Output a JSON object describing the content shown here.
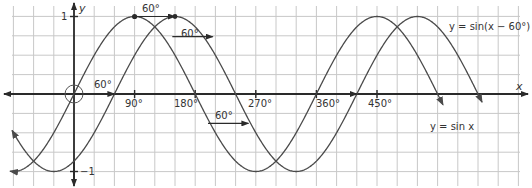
{
  "chart_data": {
    "type": "line",
    "title": "",
    "xlabel": "x",
    "ylabel": "y",
    "x_unit": "degrees",
    "xlim": [
      -96,
      680
    ],
    "ylim": [
      -1,
      1
    ],
    "grid": true,
    "x_ticks": [
      {
        "value": 90,
        "label": "90°"
      },
      {
        "value": 180,
        "label": "180°"
      },
      {
        "value": 270,
        "label": "270°"
      },
      {
        "value": 360,
        "label": "360°"
      },
      {
        "value": 450,
        "label": "450°"
      }
    ],
    "y_ticks": [
      {
        "value": 1,
        "label": "1"
      },
      {
        "value": -1,
        "label": "−1"
      }
    ],
    "series": [
      {
        "name": "y = sin x",
        "function": "sin(x)",
        "shift": 0,
        "x_start": -95,
        "x_end": 548
      },
      {
        "name": "y = sin(x − 60°)",
        "function": "sin(x - 60)",
        "shift": 60,
        "x_start": -92,
        "x_end": 606
      }
    ],
    "annotations": [
      {
        "text": "60°",
        "type": "shift-arrow",
        "from": 0,
        "to": 60,
        "y": 0
      },
      {
        "text": "60°",
        "type": "shift-arrow",
        "from": 90,
        "to": 150,
        "y": 1
      },
      {
        "text": "60°",
        "type": "shift-arrow",
        "from": 146,
        "to": 206,
        "y": 0.74
      },
      {
        "text": "60°",
        "type": "shift-arrow",
        "from": 199,
        "to": 259,
        "y": -0.38
      },
      {
        "text": "60°",
        "type": "shift-arrow",
        "from": 360,
        "to": 420,
        "y": 0
      }
    ]
  },
  "labels": {
    "x_axis": "x",
    "y_axis": "y",
    "y_max": "1",
    "y_min": "−1",
    "tick_90": "90°",
    "tick_180": "180°",
    "tick_270": "270°",
    "tick_360": "360°",
    "tick_450": "450°",
    "curve_sin": "y = sin x",
    "curve_shifted": "y = sin(x − 60°)",
    "shift_label": "60°"
  }
}
